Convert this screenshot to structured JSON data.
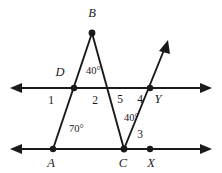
{
  "diagram": {
    "background_color": "#ffffff",
    "stroke_color": "#1a1a1a",
    "width": 222,
    "height": 173,
    "points": [
      {
        "id": "B",
        "label": "B",
        "x": 92,
        "y": 33,
        "label_x": 92,
        "label_y": 17,
        "dot": true
      },
      {
        "id": "D",
        "label": "D",
        "x": 74,
        "y": 88,
        "label_x": 60,
        "label_y": 76,
        "dot": true
      },
      {
        "id": "A",
        "label": "A",
        "x": 53,
        "y": 149,
        "label_x": 51,
        "label_y": 167,
        "dot": true
      },
      {
        "id": "C",
        "label": "C",
        "x": 124,
        "y": 149,
        "label_x": 123,
        "label_y": 167,
        "dot": true
      },
      {
        "id": "X",
        "label": "X",
        "x": 150,
        "y": 149,
        "label_x": 151,
        "label_y": 167,
        "dot": true
      },
      {
        "id": "Y",
        "label": "Y",
        "x": 150,
        "y": 88,
        "label_x": 158,
        "label_y": 103,
        "dot": true
      }
    ],
    "lines": [
      {
        "id": "upper-parallel-line",
        "x1": 12,
        "y1": 88,
        "x2": 210,
        "y2": 88,
        "arrow_start": true,
        "arrow_end": true
      },
      {
        "id": "lower-parallel-line",
        "x1": 12,
        "y1": 149,
        "x2": 210,
        "y2": 149,
        "arrow_start": true,
        "arrow_end": true
      }
    ],
    "segments": [
      {
        "id": "segment-A-to-B",
        "x1": 53,
        "y1": 149,
        "x2": 92,
        "y2": 33
      },
      {
        "id": "segment-B-to-C",
        "x1": 92,
        "y1": 33,
        "x2": 124,
        "y2": 149
      },
      {
        "id": "ray-C-to-arrow",
        "x1": 124,
        "y1": 149,
        "x2": 167,
        "y2": 43,
        "arrow_end": true
      }
    ],
    "angle_labels": [
      {
        "id": "angle-1",
        "text": "1",
        "x": 51,
        "y": 104,
        "kind": "number"
      },
      {
        "id": "angle-2",
        "text": "2",
        "x": 95,
        "y": 104,
        "kind": "number"
      },
      {
        "id": "angle-5",
        "text": "5",
        "x": 120,
        "y": 103,
        "kind": "number"
      },
      {
        "id": "angle-4",
        "text": "4",
        "x": 140,
        "y": 103,
        "kind": "number"
      },
      {
        "id": "angle-3",
        "text": "3",
        "x": 140,
        "y": 138,
        "kind": "number"
      },
      {
        "id": "angle-B-40",
        "text": "40°",
        "x": 86,
        "y": 74,
        "kind": "degree"
      },
      {
        "id": "angle-C-40",
        "text": "40°",
        "x": 124,
        "y": 121,
        "kind": "degree"
      },
      {
        "id": "angle-A-70",
        "text": "70°",
        "x": 69,
        "y": 132,
        "kind": "degree"
      }
    ]
  }
}
